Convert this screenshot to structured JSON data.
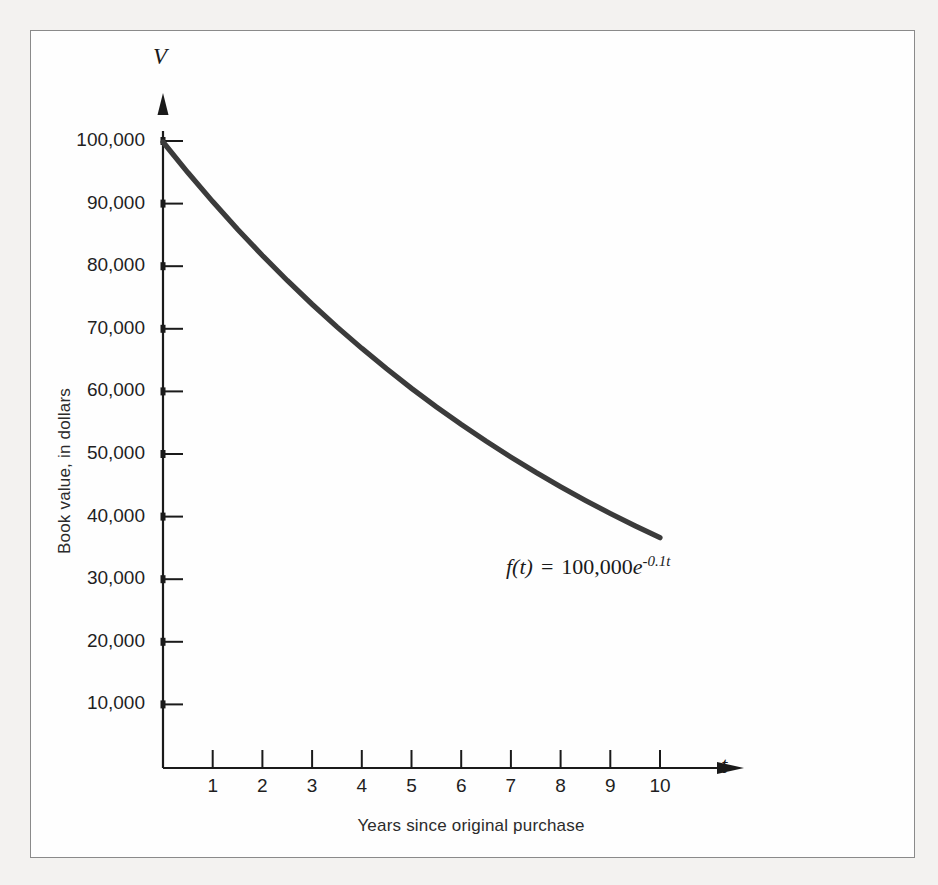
{
  "figure": {
    "background_color": "#fefefe",
    "page_color": "#f3f2f0",
    "border_color": "#8a8a8a"
  },
  "chart_data": {
    "type": "line",
    "title": "",
    "subtitle": "",
    "xlabel": "Years since original purchase",
    "ylabel": "Book value, in dollars",
    "x_axis_variable": "t",
    "y_axis_variable": "V",
    "xlim": [
      0,
      11.2
    ],
    "ylim": [
      0,
      108000
    ],
    "grid": false,
    "legend": null,
    "curve_color": "#3b3b3b",
    "curve_width": 5,
    "annotations": [
      {
        "text": "f(t) = 100,000e^(-0.1t)",
        "function": "f",
        "lhs": "f(t)",
        "equals": "=",
        "coefficient": "100,000",
        "base": "e",
        "exponent": "-0.1t",
        "x": 6.4,
        "y": 32000
      }
    ],
    "x_ticks": [
      1,
      2,
      3,
      4,
      5,
      6,
      7,
      8,
      9,
      10
    ],
    "x_tick_labels": [
      "1",
      "2",
      "3",
      "4",
      "5",
      "6",
      "7",
      "8",
      "9",
      "10"
    ],
    "y_ticks": [
      10000,
      20000,
      30000,
      40000,
      50000,
      60000,
      70000,
      80000,
      90000,
      100000
    ],
    "y_tick_labels": [
      "10,000",
      "20,000",
      "30,000",
      "40,000",
      "50,000",
      "60,000",
      "70,000",
      "80,000",
      "90,000",
      "100,000"
    ],
    "series": [
      {
        "name": "Book value",
        "equation": "V = 100000 * exp(-0.1 * t)",
        "x": [
          0,
          0.5,
          1,
          1.5,
          2,
          2.5,
          3,
          3.5,
          4,
          4.5,
          5,
          5.5,
          6,
          6.5,
          7,
          7.5,
          8,
          8.5,
          9,
          9.5,
          10
        ],
        "values": [
          100000,
          95123,
          90484,
          86071,
          81873,
          77880,
          74082,
          70469,
          67032,
          63763,
          60653,
          57695,
          54881,
          52205,
          49659,
          47237,
          44933,
          42741,
          40657,
          38674,
          36788
        ]
      }
    ]
  }
}
